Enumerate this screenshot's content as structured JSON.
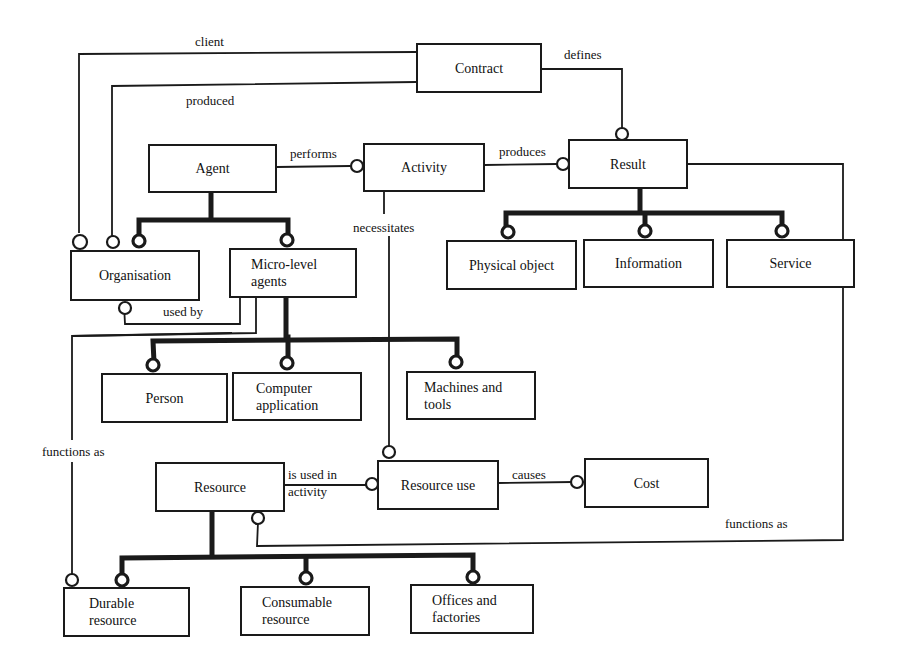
{
  "diagram": {
    "type": "entity-relationship",
    "entities": {
      "contract": "Contract",
      "agent": "Agent",
      "activity": "Activity",
      "result": "Result",
      "organisation": "Organisation",
      "micro_level_agents_1": "Micro-level",
      "micro_level_agents_2": "agents",
      "physical_object": "Physical object",
      "information": "Information",
      "service": "Service",
      "person": "Person",
      "computer_application_1": "Computer",
      "computer_application_2": "application",
      "machines_and_tools_1": "Machines and",
      "machines_and_tools_2": "tools",
      "resource": "Resource",
      "resource_use": "Resource use",
      "cost": "Cost",
      "durable_resource_1": "Durable",
      "durable_resource_2": "resource",
      "consumable_resource_1": "Consumable",
      "consumable_resource_2": "resource",
      "offices_and_factories_1": "Offices and",
      "offices_and_factories_2": "factories"
    },
    "relations": {
      "client": "client",
      "produced": "produced",
      "defines": "defines",
      "performs": "performs",
      "produces": "produces",
      "necessitates": "necessitates",
      "used_by": "used by",
      "functions_as_left": "functions as",
      "is_used_in_1": "is used in",
      "is_used_in_2": "activity",
      "causes": "causes",
      "functions_as_right": "functions as"
    },
    "edges": [
      {
        "from": "Contract",
        "to": "Organisation",
        "label": "client"
      },
      {
        "from": "Contract",
        "to": "Organisation",
        "label": "produced"
      },
      {
        "from": "Contract",
        "to": "Result",
        "label": "defines"
      },
      {
        "from": "Agent",
        "to": "Activity",
        "label": "performs"
      },
      {
        "from": "Activity",
        "to": "Result",
        "label": "produces"
      },
      {
        "from": "Activity",
        "to": "Resource use",
        "label": "necessitates"
      },
      {
        "from": "Micro-level agents",
        "to": "Organisation",
        "label": "used by"
      },
      {
        "from": "Micro-level agents",
        "to": "Durable resource",
        "label": "functions as"
      },
      {
        "from": "Resource",
        "to": "Resource use",
        "label": "is used in activity"
      },
      {
        "from": "Resource use",
        "to": "Cost",
        "label": "causes"
      },
      {
        "from": "Result",
        "to": "Resource",
        "label": "functions as"
      }
    ],
    "hierarchies": [
      {
        "parent": "Agent",
        "children": [
          "Organisation",
          "Micro-level agents"
        ]
      },
      {
        "parent": "Result",
        "children": [
          "Physical object",
          "Information",
          "Service"
        ]
      },
      {
        "parent": "Micro-level agents",
        "children": [
          "Person",
          "Computer application",
          "Machines and tools"
        ]
      },
      {
        "parent": "Resource",
        "children": [
          "Durable resource",
          "Consumable resource",
          "Offices and factories"
        ]
      }
    ]
  }
}
